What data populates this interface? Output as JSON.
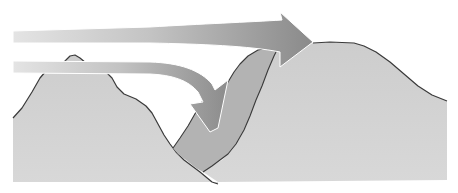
{
  "diagram": {
    "type": "illustration",
    "elements": [
      {
        "id": "left-mountain",
        "kind": "terrain"
      },
      {
        "id": "valley-fill",
        "kind": "cold-air-pool"
      },
      {
        "id": "right-mountain",
        "kind": "terrain"
      },
      {
        "id": "upper-arrow",
        "kind": "flow-arrow",
        "direction": "right, over summit"
      },
      {
        "id": "lower-arrow",
        "kind": "flow-arrow",
        "direction": "right then down into valley"
      }
    ],
    "colors": {
      "background": "#ffffff",
      "terrain": "#cfcfcf",
      "valley_fill": "#b3b3b3",
      "outline": "#3a3a3a",
      "arrow_light": "#e2e2e2",
      "arrow_dark": "#8e8e8e"
    }
  }
}
